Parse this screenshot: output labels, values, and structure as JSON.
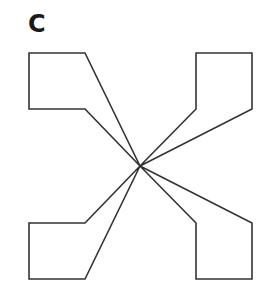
{
  "figure": {
    "label": "C",
    "stroke_color": "#333333",
    "center": [
      140,
      166
    ],
    "shapes": [
      {
        "name": "top-left-arm",
        "points": "29,53 85,53 140,166 85,109 29,109"
      },
      {
        "name": "top-right-arm",
        "points": "196,53 252,53 252,109 140,166 196,109"
      },
      {
        "name": "bottom-left-arm",
        "points": "29,223 85,223 140,166 85,279 29,279"
      },
      {
        "name": "bottom-right-arm",
        "points": "196,223 140,166 252,223 252,279 196,279"
      }
    ]
  }
}
